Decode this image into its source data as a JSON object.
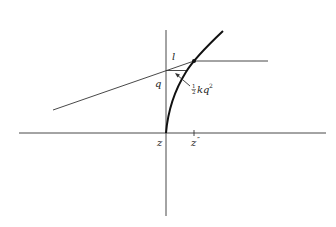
{
  "diagram": {
    "labels": {
      "l": "l",
      "q": "q",
      "half_num": "1",
      "half_den": "2",
      "kq": "kq",
      "kq_exp": "2",
      "z": "z",
      "z_dd": "z",
      "z_dd_prime": "″"
    },
    "colors": {
      "line": "#222222",
      "background": "#ffffff"
    }
  }
}
